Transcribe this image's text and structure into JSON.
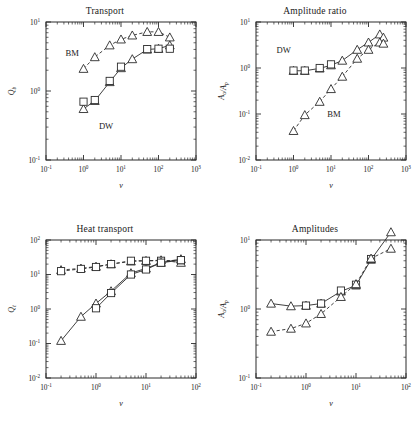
{
  "figure": {
    "panels": [
      "transport",
      "amplitude_ratio",
      "heat_transport",
      "amplitudes"
    ]
  },
  "chart_data": [
    {
      "id": "transport",
      "type": "line",
      "title": "Transport",
      "xlabel": "v",
      "ylabel": "Q_b",
      "xscale": "log",
      "yscale": "log",
      "xlim": [
        0.1,
        1000
      ],
      "ylim": [
        0.1,
        10
      ],
      "xticks": [
        "10-1",
        "100",
        "101",
        "102",
        "103"
      ],
      "yticks": [
        "10-1",
        "100",
        "101"
      ],
      "grid": false,
      "legend": "inline-annotations",
      "annotations": [
        {
          "text": "BM",
          "x": 0.5,
          "y": 3.2
        },
        {
          "text": "DW",
          "x": 4.0,
          "y": 0.28
        }
      ],
      "series": [
        {
          "name": "BM",
          "style": "dashed",
          "marker": "triangle",
          "x": [
            1,
            2,
            5,
            10,
            20,
            50,
            100,
            200
          ],
          "y": [
            2.1,
            3.1,
            4.6,
            5.6,
            6.4,
            7.2,
            7.2,
            6.0
          ]
        },
        {
          "name": "DW",
          "style": "solid",
          "marker": "triangle",
          "x": [
            1,
            2,
            5,
            10,
            20,
            50,
            100,
            200
          ],
          "y": [
            0.55,
            0.72,
            1.35,
            2.15,
            2.9,
            4.0,
            4.1,
            4.6
          ]
        },
        {
          "name": "DW-squares",
          "style": "none",
          "marker": "square",
          "x": [
            1,
            2,
            5,
            10,
            50,
            100,
            200
          ],
          "y": [
            0.7,
            0.74,
            1.4,
            2.25,
            4.05,
            4.1,
            4.1
          ]
        }
      ]
    },
    {
      "id": "amplitude_ratio",
      "type": "line",
      "title": "Amplitude ratio",
      "xlabel": "v",
      "ylabel": "A_o/A_p",
      "xscale": "log",
      "yscale": "log",
      "xlim": [
        0.1,
        1000
      ],
      "ylim": [
        0.01,
        10
      ],
      "xticks": [
        "10-1",
        "100",
        "101",
        "102",
        "103"
      ],
      "yticks": [
        "10-2",
        "10-1",
        "100",
        "101"
      ],
      "grid": false,
      "legend": "inline-annotations",
      "annotations": [
        {
          "text": "DW",
          "x": 0.55,
          "y": 2.1
        },
        {
          "text": "BM",
          "x": 12,
          "y": 0.085
        }
      ],
      "series": [
        {
          "name": "DW",
          "style": "solid",
          "marker": "triangle",
          "x": [
            1,
            2,
            5,
            10,
            20,
            50,
            100,
            200,
            250
          ],
          "y": [
            0.87,
            0.87,
            0.98,
            1.15,
            1.45,
            2.5,
            3.6,
            5.4,
            4.6
          ]
        },
        {
          "name": "DW-squares",
          "style": "none",
          "marker": "square",
          "x": [
            1,
            2,
            5,
            10
          ],
          "y": [
            0.88,
            0.88,
            1.0,
            1.2
          ]
        },
        {
          "name": "BM",
          "style": "dashed",
          "marker": "triangle",
          "x": [
            1,
            2,
            5,
            10,
            20,
            50,
            100,
            200,
            250
          ],
          "y": [
            0.043,
            0.095,
            0.185,
            0.35,
            0.65,
            1.6,
            2.5,
            3.6,
            3.4
          ]
        }
      ]
    },
    {
      "id": "heat_transport",
      "type": "line",
      "title": "Heat transport",
      "xlabel": "v",
      "ylabel": "Q_t",
      "xscale": "log",
      "yscale": "log",
      "xlim": [
        0.1,
        100
      ],
      "ylim": [
        0.01,
        100
      ],
      "xticks": [
        "10-1",
        "100",
        "101",
        "102"
      ],
      "yticks": [
        "10-2",
        "10-1",
        "100",
        "101",
        "102"
      ],
      "grid": false,
      "legend": "none",
      "annotations": [],
      "series": [
        {
          "name": "upper-dashed-triangle",
          "style": "dashed",
          "marker": "triangle",
          "x": [
            0.2,
            0.5,
            1,
            2,
            5,
            10,
            20,
            50
          ],
          "y": [
            13.5,
            15,
            17,
            20,
            24,
            25,
            26,
            22
          ]
        },
        {
          "name": "upper-dashed-square",
          "style": "dashed",
          "marker": "square",
          "x": [
            0.2,
            0.5,
            1,
            2,
            5,
            10,
            20,
            50
          ],
          "y": [
            12.5,
            14.5,
            16.5,
            20,
            25,
            25,
            25,
            26
          ]
        },
        {
          "name": "lower-solid-triangle",
          "style": "solid",
          "marker": "triangle",
          "x": [
            0.2,
            0.5,
            1,
            2,
            5,
            10,
            20,
            50
          ],
          "y": [
            0.12,
            0.6,
            1.45,
            3.3,
            11,
            15,
            22,
            28
          ]
        },
        {
          "name": "lower-solid-square",
          "style": "solid",
          "marker": "square",
          "x": [
            1,
            2,
            5,
            10,
            20,
            50
          ],
          "y": [
            1.05,
            2.9,
            10,
            14,
            22,
            26
          ]
        }
      ]
    },
    {
      "id": "amplitudes",
      "type": "line",
      "title": "Amplitudes",
      "xlabel": "v",
      "ylabel": "A_o/A_p",
      "xscale": "log",
      "yscale": "log",
      "xlim": [
        0.1,
        100
      ],
      "ylim": [
        0.1,
        10
      ],
      "xticks": [
        "10-1",
        "100",
        "101",
        "102"
      ],
      "yticks": [
        "10-1",
        "100",
        "101"
      ],
      "grid": false,
      "legend": "none",
      "annotations": [],
      "series": [
        {
          "name": "upper-solid",
          "style": "solid",
          "marker": "triangle",
          "x": [
            0.2,
            0.5,
            1,
            2,
            5,
            10,
            20,
            50
          ],
          "y": [
            1.2,
            1.1,
            1.12,
            1.2,
            1.8,
            2.2,
            5.2,
            13
          ]
        },
        {
          "name": "upper-solid-square",
          "style": "none",
          "marker": "square",
          "x": [
            1,
            2,
            5,
            10,
            20
          ],
          "y": [
            1.12,
            1.2,
            1.85,
            2.25,
            5.3
          ]
        },
        {
          "name": "lower-dashed",
          "style": "dashed",
          "marker": "triangle",
          "x": [
            0.2,
            0.5,
            1,
            2,
            5,
            10,
            20,
            50
          ],
          "y": [
            0.47,
            0.52,
            0.62,
            0.85,
            1.5,
            2.3,
            5.4,
            7.5
          ]
        }
      ]
    }
  ]
}
